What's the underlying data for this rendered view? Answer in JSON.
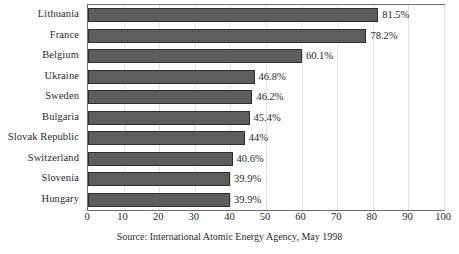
{
  "chart_data": {
    "type": "bar",
    "orientation": "horizontal",
    "title": "",
    "subtitle": "",
    "xlabel": "",
    "ylabel": "",
    "xlim": [
      0,
      100
    ],
    "xticks": [
      0,
      10,
      20,
      30,
      40,
      50,
      60,
      70,
      80,
      90,
      100
    ],
    "grid": true,
    "grid_axis": "x",
    "legend": false,
    "legend_position": "none",
    "categories": [
      "Lithuania",
      "France",
      "Belgium",
      "Ukraine",
      "Sweden",
      "Bulgaria",
      "Slovak Republic",
      "Switzerland",
      "Slovenia",
      "Hungary"
    ],
    "values": [
      81.5,
      78.2,
      60.1,
      46.8,
      46.2,
      45.4,
      44,
      40.6,
      39.9,
      39.9
    ],
    "data_labels": [
      "81.5%",
      "78.2%",
      "60.1%",
      "46.8%",
      "46.2%",
      "45.4%",
      "44%",
      "40.6%",
      "39.9%",
      "39.9%"
    ],
    "annotations": [
      "Source: International Atomic Energy Agency, May 1998"
    ],
    "colors": {
      "bar_fill": "#5d5d5d",
      "bar_border": "#2e2e2e",
      "plot_border": "#6e6e6e",
      "gridline": "#e2e2e2",
      "background": "#ffffff",
      "text": "#1f1f1f"
    }
  },
  "source": {
    "text": "Source: International Atomic Energy Agency, May 1998"
  }
}
